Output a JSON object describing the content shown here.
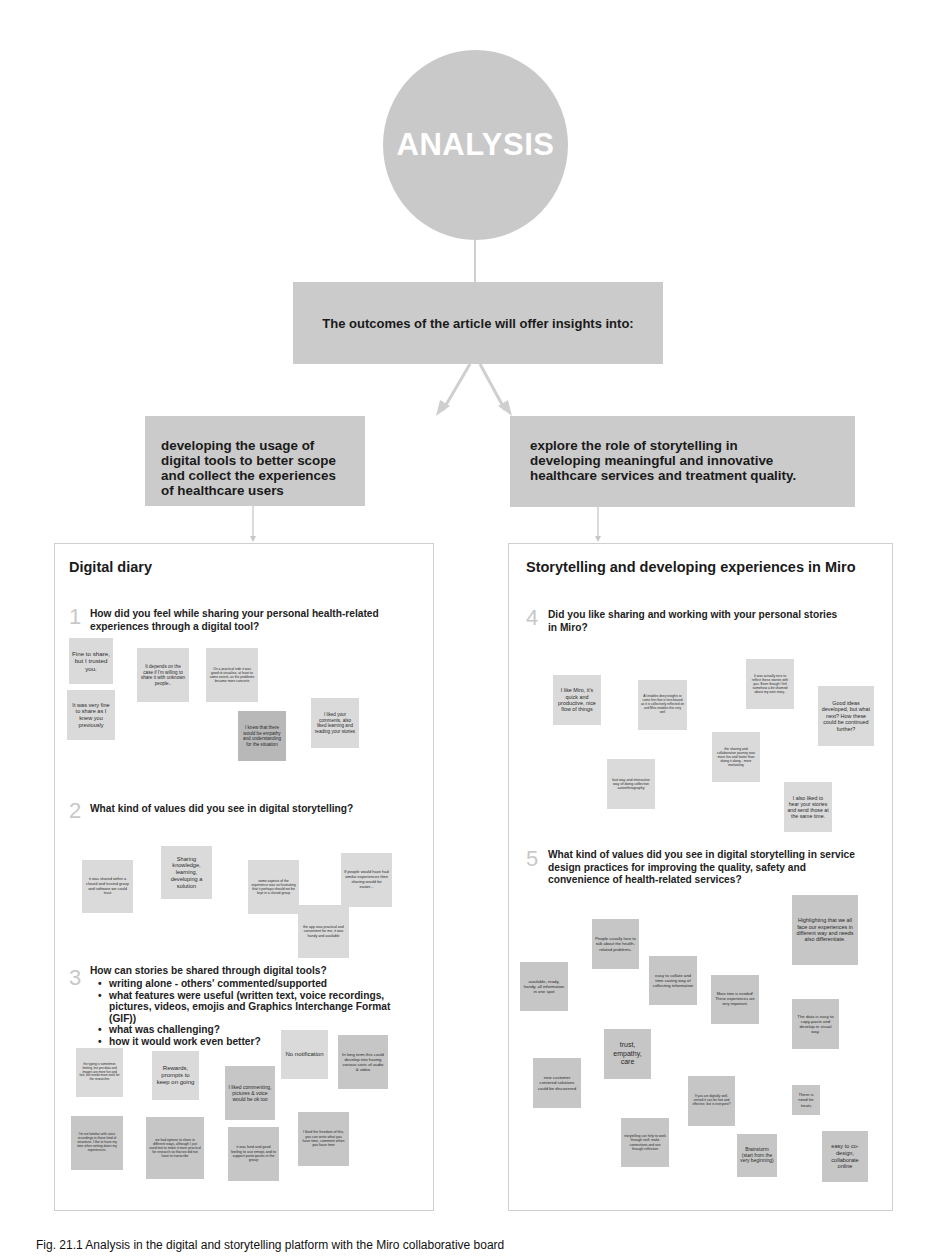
{
  "title": "ANALYSIS",
  "outcomes_box": "The outcomes of the article will offer insights into:",
  "branches": {
    "left": "developing the usage of digital tools to better scope and collect the experiences of healthcare users",
    "right": "explore the role of storytelling in developing meaningful and innovative healthcare services and treatment quality."
  },
  "panels": {
    "left": {
      "title": "Digital diary",
      "questions": [
        {
          "number": "1",
          "text": "How did you feel while sharing your personal health-related experiences through a digital tool?",
          "notes": [
            "Fine to share, but I trusted you.",
            "It was very fine to share as I knew you previously",
            "It depends on the case if I'm willing to share it with unknown people..",
            "On a practical side it was good to visualise, at least to some extent, as the problems became more concrete",
            "I knew that there would be empathy and understanding for the situation",
            "I liked your comments, also liked learning and reading your stories"
          ]
        },
        {
          "number": "2",
          "text": "What kind of values did you see in digital storytelling?",
          "notes": [
            "it was shared within a closed and trusted group and software we could trust",
            "Sharing knowledge, learning, developing a solution",
            "some aspects of the experience was so frustrating that it perhaps should not be kept in a closed group",
            "If people would have had similar experiences then sharing would be easier...",
            "the app was practical and convenient for me, it was handy and available"
          ]
        },
        {
          "number": "3",
          "text": "How can stories be shared through digital tools?",
          "bullets": [
            "writing alone - others' commented/supported",
            "what features were useful (written text, voice recordings, pictures, videos, emojis and Graphics Interchange Format (GIF))",
            "what was challenging?",
            "how it would work even better?"
          ],
          "notes": [
            "No notification",
            "In long term this could develop into having various sorts of audio & video",
            "the typing is sometimes limiting, but yes data and images are more fun and fast, but needs more work for the researcher",
            "Rewards, prompts to keep on going",
            "I liked commenting, pictures & voice would be ok too",
            "I'm not familiar with voice recordings in these kind of situations. I like to have my time when writing down my experiences.",
            "we had options to share in different ways, although I just used text to make it more practical for research so that we did not have to transcribe",
            "it was fund and good feeling to use emojis and to support participants in the group",
            "I liked the freedom of this, you can write what you have time, comment when you have time"
          ]
        }
      ]
    },
    "right": {
      "title": "Storytelling and developing experiences in Miro",
      "questions": [
        {
          "number": "4",
          "text": "Did you like sharing and working with your personal stories in Miro?",
          "notes": [
            "I like Miro, it's quick and productive, nice flow of things",
            "AI enables deep insights to come first that is less biased as it is collectively reflected on and Miro enables this very well",
            "It was actually nice to reflect these stories with you. Even though I felt somehow a bit shamed about my own story..",
            "Good ideas developed, but what next? How these could be continued further?",
            "the sharing and collaborative journey was more fun and faster than doing it along - more motivating",
            "fast way and interactive way of doing collective autoethnography",
            "I also liked to hear your stories and send those at the same time."
          ]
        },
        {
          "number": "5",
          "text": "What kind of values did you see in digital storytelling in service design practices for improving the quality, safety and convenience of health-related services?",
          "notes": [
            "Highlighting that we all face our experiences in different way and needs also differentiate.",
            "People usually love to talk about the health-related problems.",
            "easy to collate and time saving way of collecting information",
            "available, ready, handy, all information in one spot",
            "More time is needed! These experiences are very important.",
            "The data is easy to copy-paste and develop in visual way.",
            "trust, empathy, care",
            "new customer centered solutions could be discovered",
            "If you are digitally well-versed it can be fast and effective, but is everyone?",
            "There is need for treats",
            "storytelling can help to work through stuff, make connections and see through reflection",
            "Brainstorm (start from the very beginning)",
            "easy to co-design, collaborate online"
          ]
        }
      ]
    }
  },
  "caption": "Fig. 21.1  Analysis in the digital and storytelling platform with the Miro collaborative board",
  "colors": {
    "circle": "#c9c9c9",
    "box": "#cbcbcb",
    "note_light": "#dadada",
    "note_dark": "#b8b8b8",
    "connector": "#cfcfcf"
  }
}
